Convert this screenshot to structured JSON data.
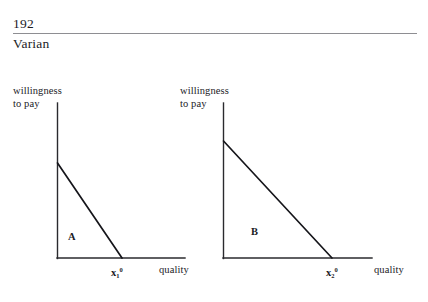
{
  "page": {
    "number": "192",
    "author": "Varian",
    "width": 428,
    "height": 302,
    "background": "#ffffff",
    "ink_color": "#1b1b1f",
    "rule_color": "#8e8e92"
  },
  "figure": {
    "panels": [
      {
        "id": "panel-a",
        "region_letter": "A",
        "y_axis_label_line1": "willingness",
        "y_axis_label_line2": "to pay",
        "x_axis_label": "quality",
        "x_tick_base": "x",
        "x_tick_sub": "1",
        "x_tick_sup": "0",
        "origin_x": 57,
        "origin_y": 258,
        "y_axis_top": 103,
        "x_axis_right": 185,
        "demand_intercept_y": 163,
        "demand_intercept_x": 122,
        "region_letter_x": 68,
        "region_letter_y": 231,
        "y_label_x": 13,
        "y_label_y": 85,
        "x_tick_label_x": 111,
        "x_tick_label_y": 265,
        "x_axis_label_x": 159,
        "x_axis_label_y": 265
      },
      {
        "id": "panel-b",
        "region_letter": "B",
        "y_axis_label_line1": "willingness",
        "y_axis_label_line2": "to pay",
        "x_axis_label": "quality",
        "x_tick_base": "x",
        "x_tick_sub": "2",
        "x_tick_sup": "0",
        "origin_x": 223,
        "origin_y": 258,
        "y_axis_top": 103,
        "x_axis_right": 372,
        "demand_intercept_y": 141,
        "demand_intercept_x": 332,
        "region_letter_x": 251,
        "region_letter_y": 226,
        "y_label_x": 180,
        "y_label_y": 85,
        "x_tick_label_x": 326,
        "x_tick_label_y": 265,
        "x_axis_label_x": 374,
        "x_axis_label_y": 265
      }
    ]
  },
  "chart_data": {
    "type": "line",
    "title": "",
    "xlabel": "quality",
    "ylabel": "willingness to pay",
    "panels": [
      {
        "name": "A",
        "description": "Linear willingness-to-pay (inverse demand) curve for consumer 1; shaded triangle A is consumer surplus.",
        "series": [
          {
            "name": "willingness to pay (consumer 1)",
            "points": [
              {
                "x": 0,
                "y": 1.0
              },
              {
                "x": 1.0,
                "y": 0
              }
            ]
          }
        ],
        "x_ticks": [
          "x_1^0"
        ],
        "y_ticks": [],
        "region_label": "A",
        "xlim": [
          0,
          1.97
        ],
        "ylim": [
          0,
          1.63
        ],
        "grid": false,
        "legend": "none"
      },
      {
        "name": "B",
        "description": "Linear willingness-to-pay (inverse demand) curve for consumer 2; triangle B is larger than A.",
        "series": [
          {
            "name": "willingness to pay (consumer 2)",
            "points": [
              {
                "x": 0,
                "y": 1.0
              },
              {
                "x": 1.0,
                "y": 0
              }
            ]
          }
        ],
        "x_ticks": [
          "x_2^0"
        ],
        "y_ticks": [],
        "region_label": "B",
        "xlim": [
          0,
          1.37
        ],
        "ylim": [
          0,
          1.32
        ],
        "grid": false,
        "legend": "none"
      }
    ]
  }
}
